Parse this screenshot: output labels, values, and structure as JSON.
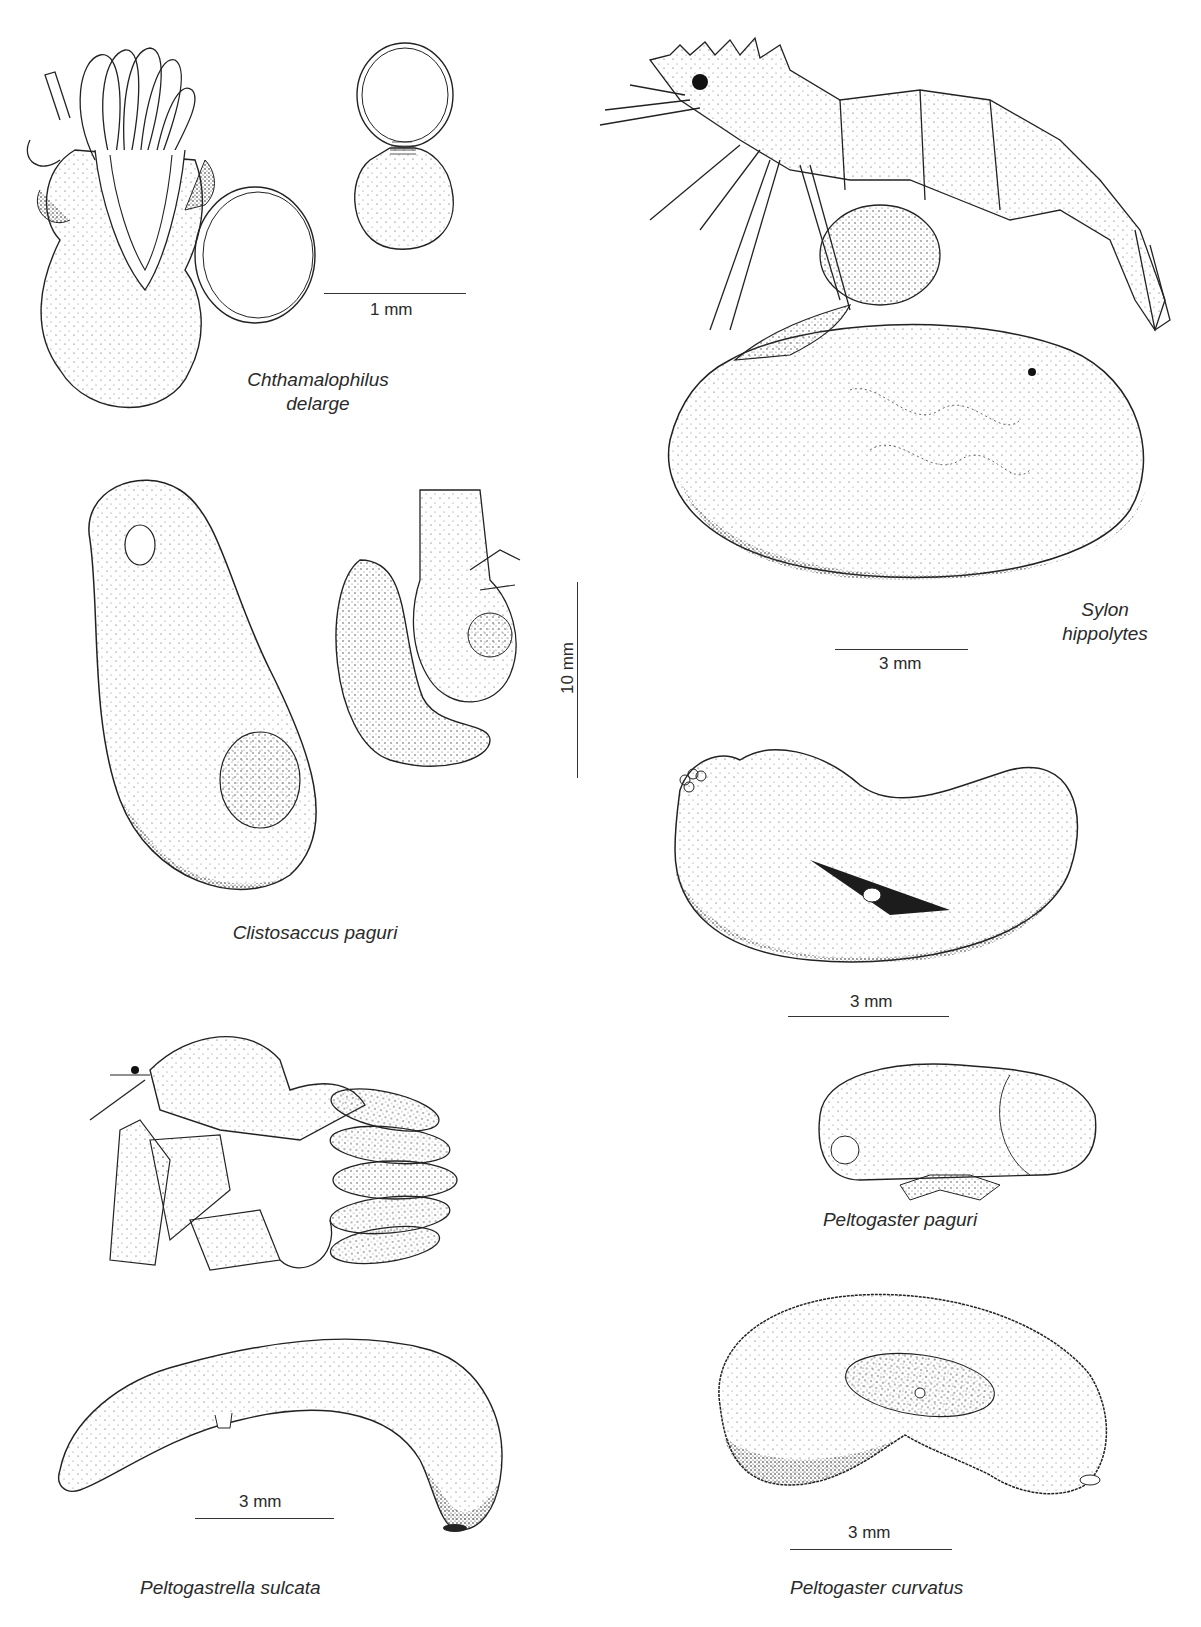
{
  "plate": {
    "background": "#ffffff",
    "ink": "#2a2a2a",
    "figures": [
      {
        "id": "chthamalophilus",
        "label_line1": "Chthamalophilus",
        "label_line2": "delarge",
        "scale": "1 mm"
      },
      {
        "id": "sylon",
        "label_line1": "Sylon",
        "label_line2": "hippolytes",
        "scale": "3 mm"
      },
      {
        "id": "clistosaccus",
        "label": "Clistosaccus paguri",
        "scale": "10 mm"
      },
      {
        "id": "peltogaster-paguri",
        "label": "Peltogaster paguri",
        "scale": "3 mm"
      },
      {
        "id": "peltogastrella",
        "label": "Peltogastrella sulcata",
        "scale": "3 mm"
      },
      {
        "id": "peltogaster-curvatus",
        "label": "Peltogaster curvatus",
        "scale": "3 mm"
      }
    ]
  }
}
